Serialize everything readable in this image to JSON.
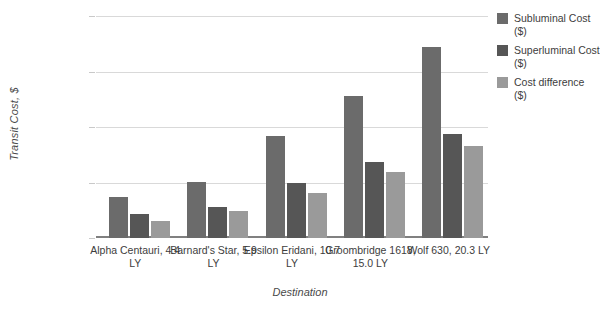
{
  "chart_data": {
    "type": "bar",
    "title": "",
    "xlabel": "Destination",
    "ylabel": "Transit Cost, $",
    "ylim": [
      0,
      12000000
    ],
    "grid": true,
    "legend_position": "right",
    "ytick_labels": [
      "12000000",
      "9000000",
      "6000000",
      "3000000",
      "0"
    ],
    "ytick_values": [
      12000000,
      9000000,
      6000000,
      3000000,
      0
    ],
    "categories": [
      "Alpha Centauri, 4.4 LY",
      "Barnard's Star, 5.9 LY",
      "Epsilon Eridani, 10.7 LY",
      "Groombridge 1618, 15.0 LY",
      "Wolf 630, 20.3 LY"
    ],
    "series": [
      {
        "name": "Subluminal Cost ($)",
        "color": "#6b6b6b",
        "values": [
          2200000,
          3050000,
          5500000,
          7700000,
          10350000
        ]
      },
      {
        "name": "Superluminal Cost ($)",
        "color": "#565656",
        "values": [
          1300000,
          1700000,
          3000000,
          4100000,
          5600000
        ]
      },
      {
        "name": "Cost difference ($)",
        "color": "#9a9a9a",
        "values": [
          900000,
          1450000,
          2450000,
          3550000,
          4950000
        ]
      }
    ]
  },
  "colors": {
    "gridline": "#d9d9d9",
    "axis": "#808080",
    "text": "#3d3d3d"
  }
}
